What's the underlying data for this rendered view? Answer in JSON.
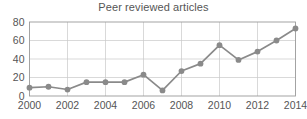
{
  "chart_data": {
    "type": "line",
    "title": "Peer reviewed articles",
    "xlabel": "",
    "ylabel": "",
    "x": [
      2000,
      2001,
      2002,
      2003,
      2004,
      2005,
      2006,
      2007,
      2008,
      2009,
      2010,
      2011,
      2012,
      2013,
      2014
    ],
    "values": [
      9,
      10,
      7,
      15,
      15,
      15,
      23,
      6,
      27,
      35,
      55,
      39,
      48,
      60,
      73
    ],
    "series": [
      {
        "name": "Peer reviewed articles",
        "values": [
          9,
          10,
          7,
          15,
          15,
          15,
          23,
          6,
          27,
          35,
          55,
          39,
          48,
          60,
          73
        ]
      }
    ],
    "xlim": [
      2000,
      2014
    ],
    "ylim": [
      0,
      80
    ],
    "xticks": [
      2000,
      2002,
      2004,
      2006,
      2008,
      2010,
      2012,
      2014
    ],
    "xtick_labels": [
      "2000",
      "2002",
      "2004",
      "2006",
      "2008",
      "2010",
      "2012",
      "2014"
    ],
    "yticks": [
      0,
      20,
      40,
      60,
      80
    ],
    "ytick_labels": [
      "0",
      "20",
      "40",
      "60",
      "80"
    ],
    "grid": true,
    "grid_axes": "both",
    "legend": false,
    "legend_position": "none",
    "marker": "circle",
    "line_color": "#8a8a8a",
    "marker_color": "#8a8a8a",
    "grid_color": "#c8c8c8",
    "axis_color": "#9a9a9a",
    "text_color": "#555555",
    "background_color": "#ffffff"
  }
}
